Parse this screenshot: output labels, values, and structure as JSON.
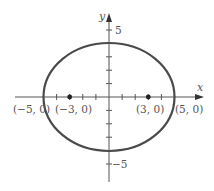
{
  "figure": {
    "equation_implied": "x^2/25 + y^2/16 = 1",
    "axes": {
      "x_label": "x",
      "y_label": "y",
      "x_range": [
        -7,
        7
      ],
      "y_range": [
        -7,
        7
      ]
    },
    "ellipse": {
      "center": [
        0,
        0
      ],
      "semi_major": 5,
      "semi_minor": 4,
      "stroke_color": "#4a4a4a"
    },
    "points": [
      {
        "label": "(−5, 0)",
        "x": -5,
        "y": 0,
        "marker": false
      },
      {
        "label": "(−3, 0)",
        "x": -3,
        "y": 0,
        "marker": true
      },
      {
        "label": "(3, 0)",
        "x": 3,
        "y": 0,
        "marker": true
      },
      {
        "label": "(5, 0)",
        "x": 5,
        "y": 0,
        "marker": false
      }
    ],
    "y_ticks_labeled": [
      {
        "value": 5,
        "label": "5"
      },
      {
        "value": -5,
        "label": "−5"
      }
    ],
    "x_ticks": [
      -4,
      -3,
      -2,
      -1,
      1,
      2,
      3,
      4
    ],
    "y_ticks": [
      -5,
      -4,
      -3,
      -2,
      -1,
      1,
      2,
      3,
      4,
      5
    ],
    "colors": {
      "axis": "#555555",
      "curve": "#4a4a4a",
      "text": "#555555"
    }
  }
}
